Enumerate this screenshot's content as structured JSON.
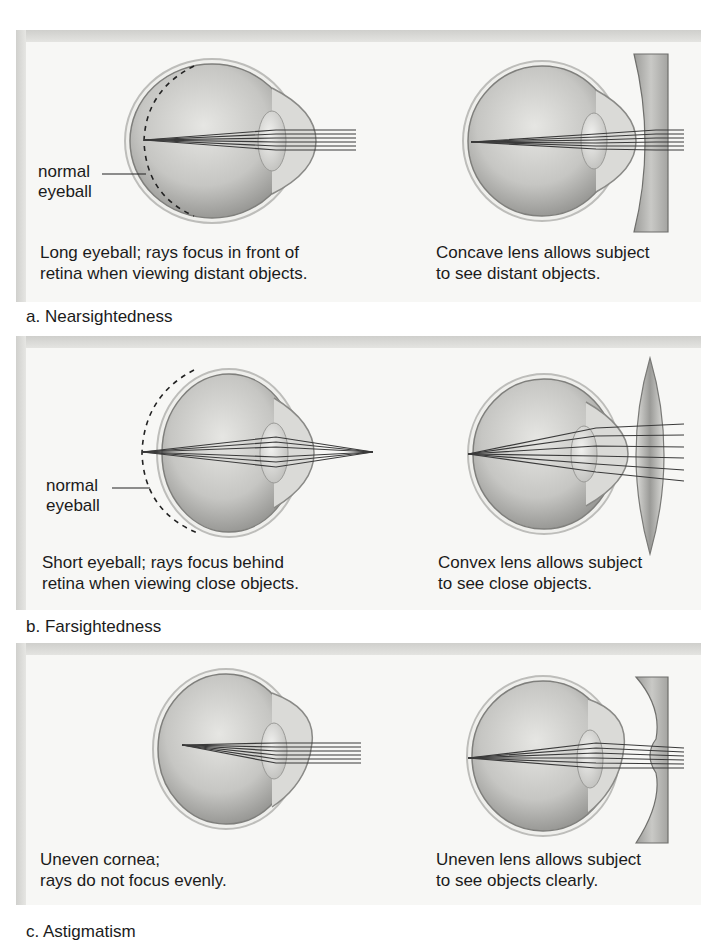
{
  "figure": {
    "panels": [
      {
        "id": "a",
        "title": "a. Nearsightedness",
        "left": {
          "annotation_line1": "normal",
          "annotation_line2": "eyeball",
          "caption_line1": "Long eyeball; rays focus in front of",
          "caption_line2": "retina when viewing distant objects."
        },
        "right": {
          "caption_line1": "Concave lens allows subject",
          "caption_line2": "to see distant objects.",
          "lens_type": "concave"
        }
      },
      {
        "id": "b",
        "title": "b. Farsightedness",
        "left": {
          "annotation_line1": "normal",
          "annotation_line2": "eyeball",
          "caption_line1": "Short eyeball; rays focus behind",
          "caption_line2": "retina when viewing close objects."
        },
        "right": {
          "caption_line1": "Convex lens allows subject",
          "caption_line2": "to see close objects.",
          "lens_type": "convex"
        }
      },
      {
        "id": "c",
        "title": "c. Astigmatism",
        "left": {
          "caption_line1": "Uneven cornea;",
          "caption_line2": "rays do not focus evenly."
        },
        "right": {
          "caption_line1": "Uneven lens allows subject",
          "caption_line2": "to see objects clearly.",
          "lens_type": "uneven"
        }
      }
    ],
    "colors": {
      "panel_bg": "#f7f7f5",
      "panel_shadow": "#d4d4d1",
      "eye_fill": "#c9c9c6",
      "ray": "#3a3a3a",
      "lens": "#b9b9b6"
    }
  }
}
